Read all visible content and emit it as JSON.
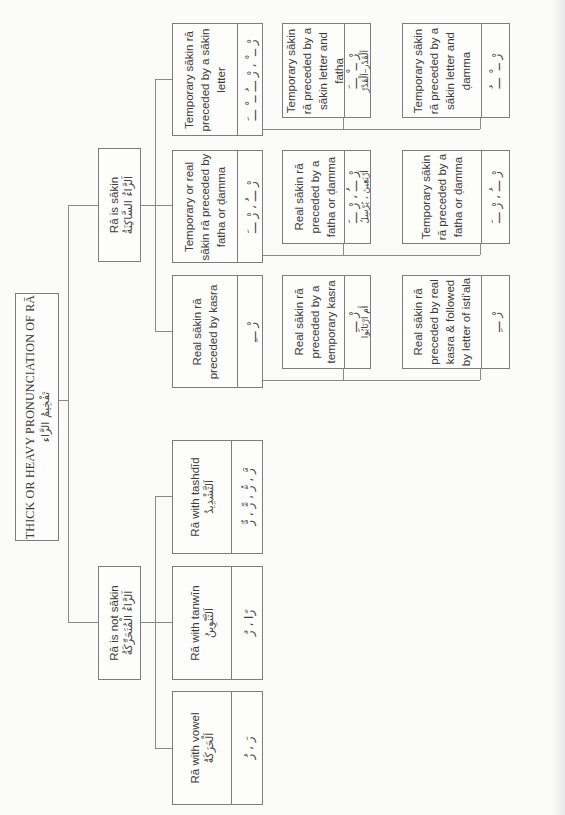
{
  "orientation": "rotated-90-ccw",
  "root": {
    "title": "THICK OR HEAVY PRONUNCIATION OF RĀ",
    "arabic": "تَفْخِيمُ الرَّاء"
  },
  "branches": {
    "sakin": {
      "label": "Rā is sākin",
      "arabic": "اَلرَّاءُ السَّاكِنَةُ",
      "children": [
        {
          "label": "Temporary sākin rā preceded by a sākin letter",
          "example": "رْ ــ ْ ، رْ ـــُ ــ ْ ـــَ",
          "children": [
            {
              "label": "Temporary sākin rā preceded by a sākin letter and fatha",
              "example": "رْ ــ ْ ـــَ",
              "word": "اَلْقَدْرِ–اَلْقَدْرْ"
            },
            {
              "label": "Temporary sākin rā preceded by a sākin letter and ḍamma",
              "example": "رْ ــ ْ ـــُ"
            }
          ]
        },
        {
          "label": "Temporary or real sākin rā preceded by fatha or ḍamma",
          "example": "رْ ـــُ ، رْ ـــَ",
          "children": [
            {
              "label": "Real sākin rā preceded by a fatha or ḍamma",
              "example": "رْ ـــُ ، رْ ـــَ",
              "word": "أَرْبَعِينَ ، يُرْسِلُ"
            },
            {
              "label": "Temporary sākin rā preceded by a fatha or ḍamma",
              "example": "رْ ـــُ ، رْ ـــَ"
            }
          ]
        },
        {
          "label": "Real sākin rā preceded by kasra",
          "example": "رْ ـــِ",
          "children": [
            {
              "label": "Real sākin rā preceded by a temporary kasra",
              "example": "رْ ـــِ",
              "word": "أَمِ ارْتَابُوا"
            },
            {
              "label": "Real sākin rā preceded by real kasra & followed by letter of isti'ala",
              "example": "رْ ـــِ"
            }
          ]
        }
      ]
    },
    "not_sakin": {
      "label": "Rā is not sākin",
      "arabic": "اَلرَّاءُ الْمُتَحَرِّكَةُ",
      "children": [
        {
          "label": "Rā with tashdīd",
          "arabic": "اَلتَّشْدِيدُ",
          "example": "رَّ ، رُّ ، رًّ ، رٌّ"
        },
        {
          "label": "Rā with tanwīn",
          "arabic": "اَلتَّنْوِينُ",
          "example": "رًا ، رٌ"
        },
        {
          "label": "Rā with vowel",
          "arabic": "اَلْحَرَكَةُ",
          "example": "رَ ، رُ"
        }
      ]
    }
  }
}
